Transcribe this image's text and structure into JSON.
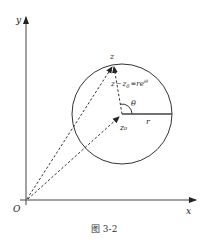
{
  "figure": {
    "caption": "图 3-2",
    "axes": {
      "x_label": "x",
      "y_label": "y",
      "origin_label": "O"
    },
    "circle": {
      "center_label": "z₀",
      "point_label": "z",
      "radius_label": "r",
      "angle_label": "θ",
      "equation_prefix": "z",
      "equation_minus": "−",
      "equation_z0": "z",
      "equation_z0_sub": "0",
      "equation_eq": "=",
      "equation_rhs": "re",
      "equation_sup": "iθ"
    },
    "colors": {
      "line": "#333333",
      "dashed": "#333333"
    }
  }
}
